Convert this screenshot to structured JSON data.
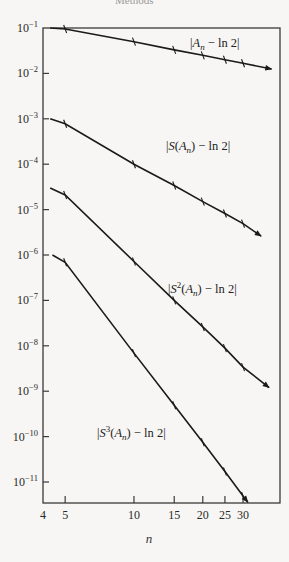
{
  "header": {
    "cut_text": "Methods"
  },
  "chart_data": {
    "type": "line",
    "title": "",
    "xlabel": "n",
    "ylabel": "",
    "x_scale": "log",
    "y_scale": "log",
    "xlim": [
      4,
      43
    ],
    "ylim": [
      3.5e-12,
      0.1
    ],
    "grid": false,
    "legend": "inline labels",
    "x_ticks": [
      4,
      5,
      10,
      15,
      20,
      25,
      30
    ],
    "x_tick_labels": [
      "4",
      "5",
      "10",
      "15",
      "20",
      "25",
      "30"
    ],
    "y_ticks": [
      0.1,
      0.01,
      0.001,
      0.0001,
      1e-05,
      1e-06,
      1e-07,
      1e-08,
      1e-09,
      1e-10,
      1e-11
    ],
    "y_tick_labels": [
      {
        "base": "10",
        "exp": "−1"
      },
      {
        "base": "10",
        "exp": "−2"
      },
      {
        "base": "10",
        "exp": "−3"
      },
      {
        "base": "10",
        "exp": "−4"
      },
      {
        "base": "10",
        "exp": "−5"
      },
      {
        "base": "10",
        "exp": "−6"
      },
      {
        "base": "10",
        "exp": "−7"
      },
      {
        "base": "10",
        "exp": "−8"
      },
      {
        "base": "10",
        "exp": "−9"
      },
      {
        "base": "10",
        "exp": "−10"
      },
      {
        "base": "10",
        "exp": "−11"
      }
    ],
    "x": [
      5,
      10,
      15,
      20,
      25,
      30
    ],
    "series": [
      {
        "name": "|A_n − ln 2|",
        "label_parts": {
          "pre": "|A",
          "sub": "n",
          "post": " − ln 2|",
          "sup": ""
        },
        "values": [
          0.095,
          0.05,
          0.033,
          0.025,
          0.02,
          0.0167
        ],
        "line_start": [
          4.3,
          0.1
        ],
        "arrow_end": [
          40,
          0.0125
        ],
        "label_pos": [
          190,
          47
        ]
      },
      {
        "name": "|S(A_n) − ln 2|",
        "label_parts": {
          "pre": "|S(A",
          "sub": "n",
          "post": ") − ln 2|",
          "sup": ""
        },
        "values": [
          0.00078,
          0.0001,
          3.4e-05,
          1.5e-05,
          8.2e-06,
          4.9e-06
        ],
        "line_start": [
          4.3,
          0.001
        ],
        "arrow_end": [
          36,
          2.6e-06
        ],
        "label_pos": [
          166,
          150
        ]
      },
      {
        "name": "|S²(A_n) − ln 2|",
        "label_parts": {
          "pre": "|S",
          "sup": "2",
          "mid": "(A",
          "sub": "n",
          "post": ") − ln 2|"
        },
        "values": [
          2.1e-05,
          7.2e-07,
          1e-07,
          2.6e-08,
          8.9e-09,
          3.4e-09
        ],
        "line_start": [
          4.3,
          3e-05
        ],
        "arrow_end": [
          39,
          1.2e-09
        ],
        "label_pos": [
          168,
          293
        ]
      },
      {
        "name": "|S³(A_n) − ln 2|",
        "label_parts": {
          "pre": "|S",
          "sup": "3",
          "mid": "(A",
          "sub": "n",
          "post": ") − ln 2|"
        },
        "values": [
          6.9e-07,
          6.9e-09,
          4.9e-10,
          7.5e-11,
          1.7e-11,
          4.9e-12
        ],
        "line_start": [
          4.4,
          1e-06
        ],
        "arrow_end": [
          31.5,
          3.6e-12
        ],
        "label_pos": [
          97,
          437
        ]
      }
    ]
  },
  "layout": {
    "plot_left": 43,
    "plot_right": 280,
    "plot_top": 28,
    "plot_bottom": 503,
    "x_log_min": 0.60206,
    "px_per_decade_x": 228.6,
    "y_log_max": -1,
    "px_per_decade_y": 45.4,
    "line_color": "#1a1a1a",
    "frame_color": "#3a3a3a"
  }
}
